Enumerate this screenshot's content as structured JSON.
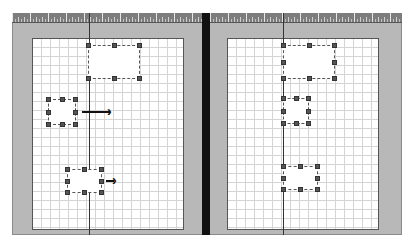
{
  "canvas": {
    "frame_color": "#b8b8b8",
    "page_color": "#ffffff",
    "grid_color": "#d4d4d4",
    "divider_color": "#111111"
  },
  "panels": [
    {
      "name": "before",
      "shapes": [
        {
          "id": "top-rect",
          "x": 88,
          "y": 45,
          "w": 52,
          "h": 34
        },
        {
          "id": "mid-rect",
          "x": 48,
          "y": 98,
          "w": 28,
          "h": 28,
          "arrow": "long"
        },
        {
          "id": "bottom-rect",
          "x": 67,
          "y": 169,
          "w": 35,
          "h": 24,
          "arrow": "short"
        }
      ]
    },
    {
      "name": "after",
      "shapes": [
        {
          "id": "top-rect",
          "x": 283,
          "y": 45,
          "w": 52,
          "h": 34
        },
        {
          "id": "mid-rect",
          "x": 283,
          "y": 98,
          "w": 26,
          "h": 26
        },
        {
          "id": "bottom-rect",
          "x": 283,
          "y": 166,
          "w": 35,
          "h": 24
        }
      ]
    }
  ],
  "arrows": {
    "long_glyph": "›",
    "short_glyph": "›"
  },
  "caption": {
    "text": ""
  }
}
